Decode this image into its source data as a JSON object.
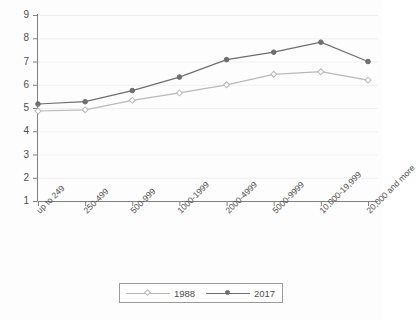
{
  "chart_data": {
    "type": "line",
    "title": "",
    "subtitle": "",
    "xlabel": "",
    "ylabel": "",
    "ylim": [
      1,
      9
    ],
    "yticks": [
      1,
      2,
      3,
      4,
      5,
      6,
      7,
      8,
      9
    ],
    "grid": true,
    "legend_position": "bottom",
    "categories": [
      "up to 249",
      "250-499",
      "500-999",
      "1000-1999",
      "2000-4999",
      "5000-9999",
      "10,000-19,999",
      "20,000 and more"
    ],
    "series": [
      {
        "name": "1988",
        "color": "#b9b9b9",
        "marker": "hollow-diamond",
        "values": [
          4.87,
          4.92,
          5.33,
          5.65,
          6.0,
          6.45,
          6.56,
          6.2
        ]
      },
      {
        "name": "2017",
        "color": "#6e6e6e",
        "marker": "filled-circle",
        "values": [
          5.17,
          5.27,
          5.75,
          6.33,
          7.08,
          7.4,
          7.83,
          7.0
        ]
      }
    ]
  },
  "legend": {
    "entries": [
      {
        "label": "1988"
      },
      {
        "label": "2017"
      }
    ]
  },
  "colors": {
    "series_1988": "#b9b9b9",
    "series_2017": "#6e6e6e",
    "axis": "#808080",
    "grid": "#f0f0f0",
    "text": "#4d4d4d",
    "background": "#fdfdfd"
  }
}
